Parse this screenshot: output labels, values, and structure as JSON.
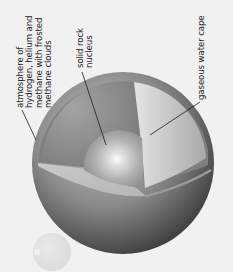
{
  "diagram": {
    "labels": {
      "atmosphere": [
        "atmosphere of",
        "hydrogen, helium and",
        "methane with frosted",
        "methane clouds"
      ],
      "nucleus": [
        "solid rock",
        "nucleus"
      ],
      "water": [
        "gaseous water cape"
      ]
    },
    "colors": {
      "background": "#f1f1f1",
      "sphere_light": "#b9b9b9",
      "sphere_dark": "#3c3c3c",
      "leader_line": "#1a1a1a"
    }
  }
}
